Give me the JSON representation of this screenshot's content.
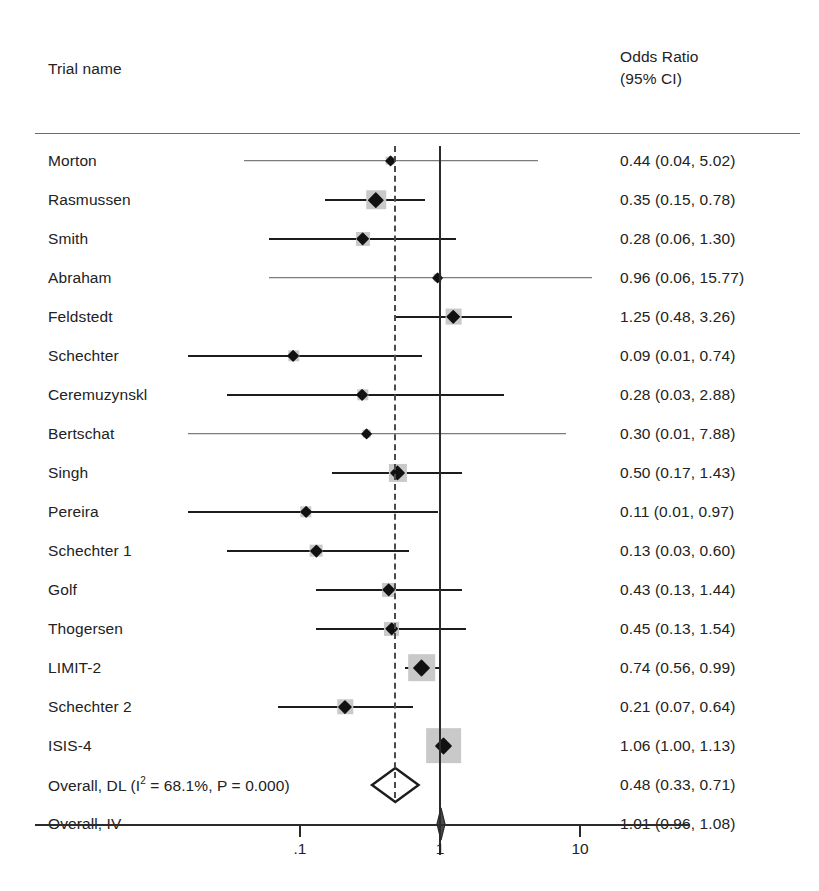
{
  "header": {
    "trial_name_label": "Trial name",
    "effect_header_line1": "Odds Ratio",
    "effect_header_line2": "(95% CI)"
  },
  "axis": {
    "ticks": [
      {
        "label": ".1",
        "value": 0.1
      },
      {
        "label": "1",
        "value": 1
      },
      {
        "label": "10",
        "value": 10
      }
    ],
    "scale": "log10",
    "null_value": 1,
    "pooled_reference_value": 0.48
  },
  "colors": {
    "text": "#222222",
    "marker": "#111111",
    "weight_box": "#c9c9c9",
    "null_line": "#2b2b2b",
    "pooled_line": "#4a4a4a",
    "rule": "#6b6b6b"
  },
  "chart_data": {
    "type": "forest",
    "title": "",
    "xlabel": "",
    "ylabel": "",
    "effect_measure": "Odds Ratio",
    "ci_level": "95% CI",
    "xscale": "log",
    "xlim": [
      0.005,
      25
    ],
    "xticks": [
      0.1,
      1,
      10
    ],
    "xticklabels": [
      ".1",
      "1",
      "10"
    ],
    "null_line": 1,
    "pooled_dashed_line": 0.48,
    "grid": false,
    "legend": "none",
    "rows": [
      {
        "label": "Morton",
        "effect_text": "0.44 (0.04, 5.02)",
        "or": 0.44,
        "lcl": 0.04,
        "ucl": 5.02,
        "weight": 2,
        "type": "study"
      },
      {
        "label": "Rasmussen",
        "effect_text": "0.35 (0.15, 0.78)",
        "or": 0.35,
        "lcl": 0.15,
        "ucl": 0.78,
        "weight": 10,
        "type": "study"
      },
      {
        "label": "Smith",
        "effect_text": "0.28 (0.06, 1.30)",
        "or": 0.28,
        "lcl": 0.06,
        "ucl": 1.3,
        "weight": 6,
        "type": "study"
      },
      {
        "label": "Abraham",
        "effect_text": "0.96 (0.06, 15.77)",
        "or": 0.96,
        "lcl": 0.06,
        "ucl": 15.77,
        "weight": 2,
        "type": "study"
      },
      {
        "label": "Feldstedt",
        "effect_text": "1.25 (0.48, 3.26)",
        "or": 1.25,
        "lcl": 0.48,
        "ucl": 3.26,
        "weight": 8,
        "type": "study"
      },
      {
        "label": "Schechter",
        "effect_text": "0.09 (0.01, 0.74)",
        "or": 0.09,
        "lcl": 0.01,
        "ucl": 0.74,
        "weight": 4,
        "type": "study"
      },
      {
        "label": "Ceremuzynskl",
        "effect_text": "0.28 (0.03, 2.88)",
        "or": 0.28,
        "lcl": 0.03,
        "ucl": 2.88,
        "weight": 4,
        "type": "study"
      },
      {
        "label": "Bertschat",
        "effect_text": "0.30 (0.01, 7.88)",
        "or": 0.3,
        "lcl": 0.01,
        "ucl": 7.88,
        "weight": 2,
        "type": "study"
      },
      {
        "label": "Singh",
        "effect_text": "0.50 (0.17, 1.43)",
        "or": 0.5,
        "lcl": 0.17,
        "ucl": 1.43,
        "weight": 9,
        "type": "study"
      },
      {
        "label": "Pereira",
        "effect_text": "0.11 (0.01, 0.97)",
        "or": 0.11,
        "lcl": 0.01,
        "ucl": 0.97,
        "weight": 4,
        "type": "study"
      },
      {
        "label": "Schechter 1",
        "effect_text": "0.13 (0.03, 0.60)",
        "or": 0.13,
        "lcl": 0.03,
        "ucl": 0.6,
        "weight": 5,
        "type": "study"
      },
      {
        "label": "Golf",
        "effect_text": "0.43 (0.13, 1.44)",
        "or": 0.43,
        "lcl": 0.13,
        "ucl": 1.44,
        "weight": 6,
        "type": "study"
      },
      {
        "label": "Thogersen",
        "effect_text": "0.45 (0.13, 1.54)",
        "or": 0.45,
        "lcl": 0.13,
        "ucl": 1.54,
        "weight": 6,
        "type": "study"
      },
      {
        "label": "LIMIT-2",
        "effect_text": "0.74 (0.56, 0.99)",
        "or": 0.74,
        "lcl": 0.56,
        "ucl": 0.99,
        "weight": 16,
        "type": "study"
      },
      {
        "label": "Schechter 2",
        "effect_text": "0.21 (0.07, 0.64)",
        "or": 0.21,
        "lcl": 0.07,
        "ucl": 0.64,
        "weight": 7,
        "type": "study"
      },
      {
        "label": "ISIS-4",
        "effect_text": "1.06 (1.00, 1.13)",
        "or": 1.06,
        "lcl": 1.0,
        "ucl": 1.13,
        "weight": 22,
        "type": "study"
      },
      {
        "label": "Overall, DL (I² = 68.1%, P = 0.000)",
        "label_pre": "Overall, DL (I",
        "label_sup": "2",
        "label_post": " = 68.1%, P = 0.000)",
        "effect_text": "0.48 (0.33, 0.71)",
        "or": 0.48,
        "lcl": 0.33,
        "ucl": 0.71,
        "weight": 0,
        "type": "summary-open"
      },
      {
        "label": "Overall, IV",
        "effect_text": "1.01 (0.96, 1.08)",
        "or": 1.01,
        "lcl": 0.96,
        "ucl": 1.08,
        "weight": 0,
        "type": "summary-solid"
      }
    ]
  }
}
